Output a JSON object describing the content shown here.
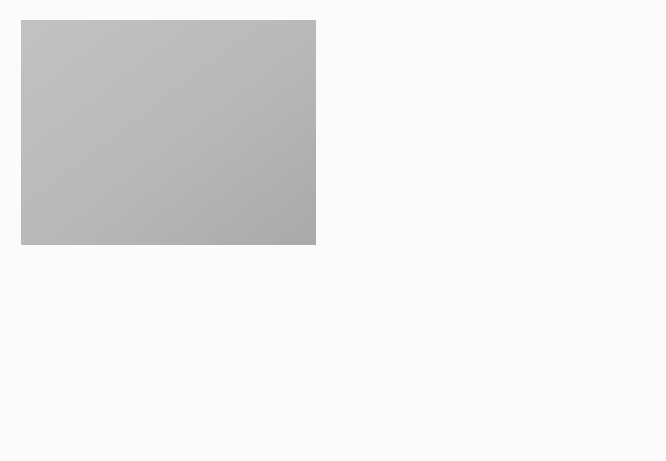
{
  "colors": {
    "page_bg": "#fbfbfb",
    "panel_bg": "#b9b9b9",
    "header_fill": "#8e8e8e",
    "ellipse_fill": "#9b9b9b",
    "arrow_fill": "#2e2e2e",
    "circle_fill": "#b4b4b4",
    "star_fill": "#6f6f6f"
  },
  "headers": {
    "lipid": {
      "line1": "Lipid",
      "line2": "pathway"
    },
    "carb": {
      "line1": "Carbohydrate",
      "line2": "pathway"
    },
    "protein": {
      "line1": "Protein",
      "line2": "pathway"
    }
  },
  "nodes": {
    "triglyceride": "Triglyceride",
    "fatty_acids": {
      "line1": "Fatty acids",
      "line2": "and glycerol"
    },
    "acetyl_left": {
      "line1": "Acetyl CoA",
      "line2_pre": "(contains B",
      "line2_sub": "5",
      "line2_post": ")"
    },
    "glycogen": "Glycogen",
    "glucose": "Glucose",
    "protein": "Protein",
    "amino_acids": "Amino acids",
    "acetyl_right": {
      "line1": "Acetyl CoA",
      "line2_pre": "(contains B",
      "line2_sub": "5",
      "line2_post": ")"
    },
    "end_products": {
      "co2": "CO",
      "co2_sub": "2",
      "plus1": "+",
      "h2o_pre": "H",
      "h2o_sub": "2",
      "h2o_post": "O",
      "plus2": "+",
      "energy": "Energy"
    }
  },
  "cofactors": {
    "lipid_tg_to_fa": [],
    "lipid_fa_to_tg": [
      {
        "b": "B",
        "s": "3"
      }
    ],
    "lipid_fa_to_acetyl": [
      {
        "b": "B",
        "s": "3"
      },
      {
        "b": "B",
        "s": "5"
      },
      {
        "b": "Biotin",
        "s": ""
      }
    ],
    "lipid_acetyl_to_fa": [
      {
        "b": "B",
        "s": "1"
      },
      {
        "b": "B",
        "s": "2"
      },
      {
        "b": "B",
        "s": "3"
      },
      {
        "b": "B",
        "s": "5"
      },
      {
        "b": "B",
        "s": "12"
      },
      {
        "b": "Biotin",
        "s": ""
      }
    ],
    "lipid_acetyl_to_energy_top": "B₂, B₃",
    "lipid_acetyl_to_energy_bottom": "B₉, B₁₂",
    "carb_glycogen_to_glucose": [
      {
        "b": "B",
        "s": "6"
      }
    ],
    "carb_glucose_to_energy_left": [
      {
        "b": "B",
        "s": "1"
      },
      {
        "b": "B",
        "s": "2"
      },
      {
        "b": "B",
        "s": "3"
      }
    ],
    "carb_glucose_to_energy_right": [
      {
        "b": "B",
        "s": "5"
      },
      {
        "b": "Biotin",
        "s": ""
      }
    ],
    "protein_protein_to_amino": [
      {
        "b": "B",
        "s": "3"
      }
    ],
    "protein_amino_to_protein": [
      {
        "b": "B",
        "s": "6"
      },
      {
        "b": "B",
        "s": "9"
      },
      {
        "b": "B",
        "s": "12"
      },
      {
        "b": "C",
        "s": ""
      },
      {
        "b": "K",
        "s": ""
      }
    ],
    "protein_amino_to_glucose_top": "B₆,B₉, B₁₂",
    "protein_amino_to_glucose_bottom": "Biotin",
    "protein_amino_to_acetyl": [
      {
        "b": "B",
        "s": "6"
      },
      {
        "b": "B",
        "s": "9"
      },
      {
        "b": "B",
        "s": "12"
      },
      {
        "b": "Biotin",
        "s": ""
      }
    ],
    "protein_acetyl_to_amino": [
      {
        "b": "B",
        "s": "6"
      }
    ],
    "protein_acetyl_to_energy_top": "B₂, B₃",
    "protein_acetyl_to_energy_bottom": "B₉, B₁₂"
  }
}
